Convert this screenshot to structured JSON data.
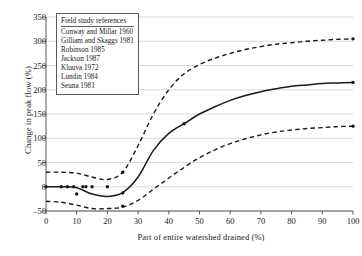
{
  "chart_data": {
    "type": "line",
    "title": "",
    "xlabel": "Part of entire watershed drained (%)",
    "ylabel": "Change in peak flow (%)",
    "xlim": [
      0,
      100
    ],
    "ylim": [
      -50,
      350
    ],
    "xticks": [
      0,
      10,
      20,
      30,
      40,
      50,
      60,
      70,
      80,
      90,
      100
    ],
    "yticks": [
      -50,
      0,
      50,
      100,
      150,
      200,
      250,
      300,
      350
    ],
    "grid": "horizontal",
    "legend_position": "top-left",
    "series": [
      {
        "name": "upper-bound",
        "style": "dashed",
        "x": [
          0,
          5,
          10,
          15,
          20,
          25,
          30,
          35,
          40,
          45,
          50,
          55,
          60,
          65,
          70,
          75,
          80,
          85,
          90,
          95,
          100
        ],
        "values": [
          30,
          30,
          28,
          20,
          15,
          30,
          85,
          150,
          200,
          233,
          252,
          265,
          275,
          283,
          289,
          294,
          297,
          300,
          302,
          304,
          305
        ]
      },
      {
        "name": "central-trend",
        "style": "solid",
        "x": [
          0,
          5,
          10,
          15,
          20,
          25,
          30,
          35,
          40,
          45,
          50,
          55,
          60,
          65,
          70,
          75,
          80,
          85,
          90,
          95,
          100
        ],
        "values": [
          0,
          0,
          -2,
          -15,
          -20,
          -12,
          20,
          75,
          110,
          130,
          150,
          165,
          178,
          188,
          196,
          202,
          207,
          210,
          213,
          214,
          215
        ]
      },
      {
        "name": "lower-bound",
        "style": "dashed",
        "x": [
          0,
          5,
          10,
          15,
          20,
          25,
          30,
          35,
          40,
          45,
          50,
          55,
          60,
          65,
          70,
          75,
          80,
          85,
          90,
          95,
          100
        ],
        "values": [
          -30,
          -32,
          -38,
          -45,
          -45,
          -42,
          -28,
          -5,
          18,
          40,
          60,
          76,
          89,
          99,
          107,
          113,
          117,
          120,
          122,
          124,
          125
        ]
      }
    ],
    "markers": [
      {
        "x": 0,
        "y": 0
      },
      {
        "x": 5,
        "y": 0
      },
      {
        "x": 7,
        "y": 0
      },
      {
        "x": 9,
        "y": 0
      },
      {
        "x": 10,
        "y": -15
      },
      {
        "x": 12,
        "y": 0
      },
      {
        "x": 13,
        "y": 0
      },
      {
        "x": 15,
        "y": 0
      },
      {
        "x": 20,
        "y": 0
      },
      {
        "x": 25,
        "y": 30
      },
      {
        "x": 25,
        "y": -13
      },
      {
        "x": 25,
        "y": -40
      },
      {
        "x": 45,
        "y": 130
      },
      {
        "x": 100,
        "y": 305
      },
      {
        "x": 100,
        "y": 215
      },
      {
        "x": 100,
        "y": 125
      }
    ]
  },
  "legend": {
    "title": "Field study references",
    "items": [
      "Conway and Millar 1960",
      "Gilliam and Skaggs 1981",
      "Robinson 1985",
      "Jackson 1987",
      "Kluuva 1972",
      "Lundin 1984",
      "Seuna 1981"
    ]
  },
  "colors": {
    "line": "#1a1a1a",
    "grid": "#c8c8d0",
    "axis": "#4a4a4a",
    "background": "#ffffff"
  }
}
